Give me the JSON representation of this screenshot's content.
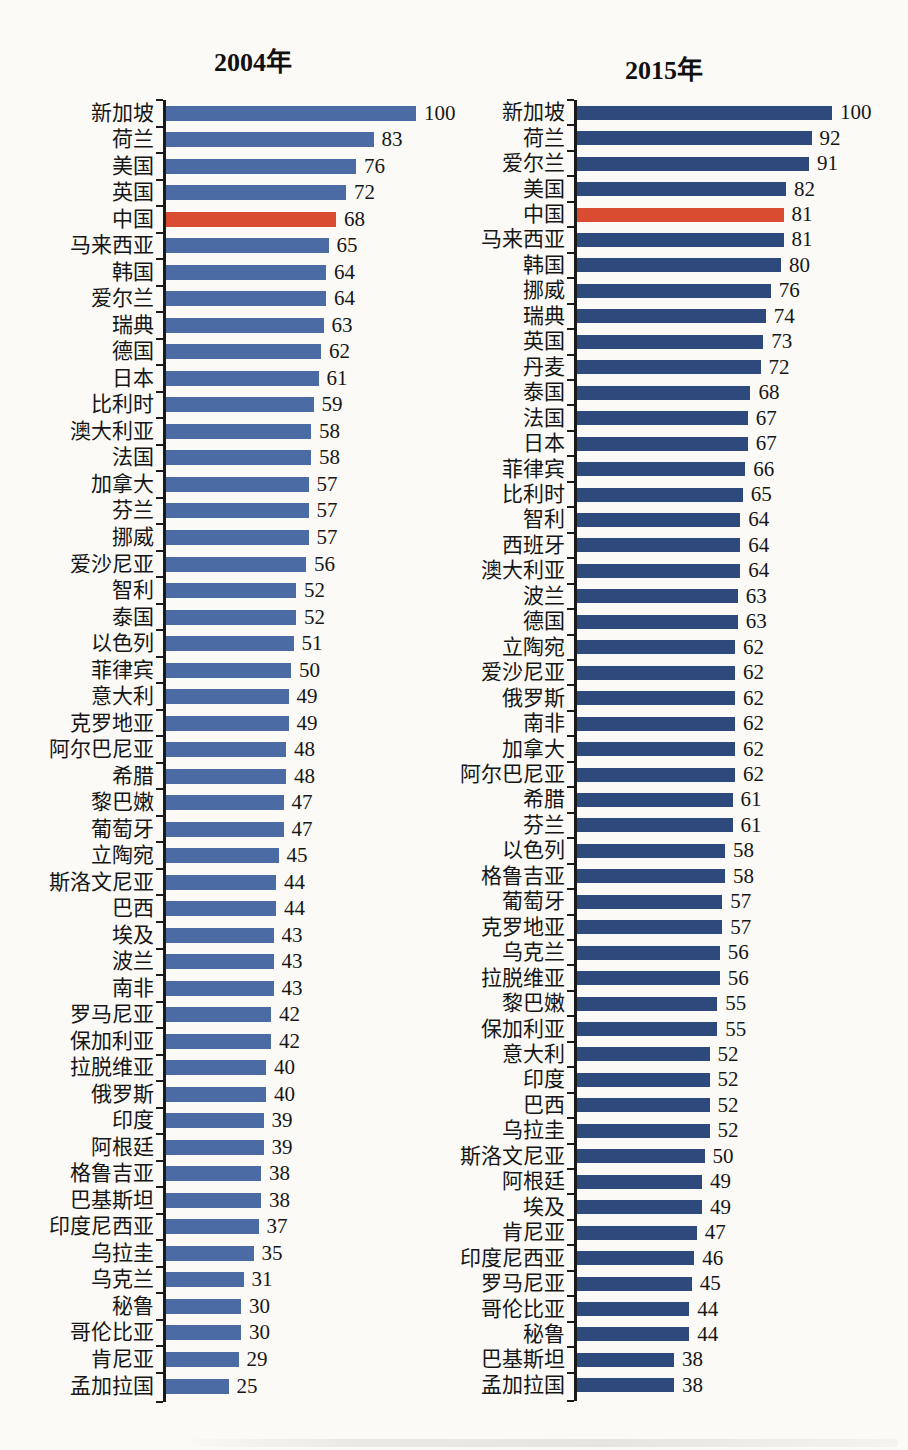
{
  "page": {
    "background": "#fbfaf6",
    "axis_color": "#1a1a1a"
  },
  "chart_data": [
    {
      "type": "bar",
      "orientation": "horizontal",
      "title": "2004年",
      "xlim": [
        0,
        100
      ],
      "grid": false,
      "legend": "none",
      "bar_color": "#4a6ba3",
      "highlight_color": "#da4c31",
      "highlight_category": "中国",
      "categories": [
        "新加坡",
        "荷兰",
        "美国",
        "英国",
        "中国",
        "马来西亚",
        "韩国",
        "爱尔兰",
        "瑞典",
        "德国",
        "日本",
        "比利时",
        "澳大利亚",
        "法国",
        "加拿大",
        "芬兰",
        "挪威",
        "爱沙尼亚",
        "智利",
        "泰国",
        "以色列",
        "菲律宾",
        "意大利",
        "克罗地亚",
        "阿尔巴尼亚",
        "希腊",
        "黎巴嫩",
        "葡萄牙",
        "立陶宛",
        "斯洛文尼亚",
        "巴西",
        "埃及",
        "波兰",
        "南非",
        "罗马尼亚",
        "保加利亚",
        "拉脱维亚",
        "俄罗斯",
        "印度",
        "阿根廷",
        "格鲁吉亚",
        "巴基斯坦",
        "印度尼西亚",
        "乌拉圭",
        "乌克兰",
        "秘鲁",
        "哥伦比亚",
        "肯尼亚",
        "孟加拉国"
      ],
      "values": [
        100,
        83,
        76,
        72,
        68,
        65,
        64,
        64,
        63,
        62,
        61,
        59,
        58,
        58,
        57,
        57,
        57,
        56,
        52,
        52,
        51,
        50,
        49,
        49,
        48,
        48,
        47,
        47,
        45,
        44,
        44,
        43,
        43,
        43,
        42,
        42,
        40,
        40,
        39,
        39,
        38,
        38,
        37,
        35,
        31,
        30,
        30,
        29,
        25
      ]
    },
    {
      "type": "bar",
      "orientation": "horizontal",
      "title": "2015年",
      "xlim": [
        0,
        100
      ],
      "grid": false,
      "legend": "none",
      "bar_color": "#2e4a7c",
      "highlight_color": "#da4c31",
      "highlight_category": "中国",
      "categories": [
        "新加坡",
        "荷兰",
        "爱尔兰",
        "美国",
        "中国",
        "马来西亚",
        "韩国",
        "挪威",
        "瑞典",
        "英国",
        "丹麦",
        "泰国",
        "法国",
        "日本",
        "菲律宾",
        "比利时",
        "智利",
        "西班牙",
        "澳大利亚",
        "波兰",
        "德国",
        "立陶宛",
        "爱沙尼亚",
        "俄罗斯",
        "南非",
        "加拿大",
        "阿尔巴尼亚",
        "希腊",
        "芬兰",
        "以色列",
        "格鲁吉亚",
        "葡萄牙",
        "克罗地亚",
        "乌克兰",
        "拉脱维亚",
        "黎巴嫩",
        "保加利亚",
        "意大利",
        "印度",
        "巴西",
        "乌拉圭",
        "斯洛文尼亚",
        "阿根廷",
        "埃及",
        "肯尼亚",
        "印度尼西亚",
        "罗马尼亚",
        "哥伦比亚",
        "秘鲁",
        "巴基斯坦",
        "孟加拉国"
      ],
      "values": [
        100,
        92,
        91,
        82,
        81,
        81,
        80,
        76,
        74,
        73,
        72,
        68,
        67,
        67,
        66,
        65,
        64,
        64,
        64,
        63,
        63,
        62,
        62,
        62,
        62,
        62,
        62,
        61,
        61,
        58,
        58,
        57,
        57,
        56,
        56,
        55,
        55,
        52,
        52,
        52,
        52,
        50,
        49,
        49,
        47,
        46,
        45,
        44,
        44,
        38,
        38
      ]
    }
  ]
}
